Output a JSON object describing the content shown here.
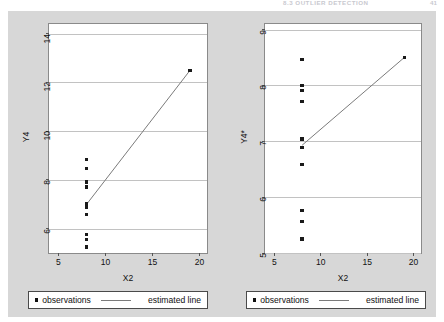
{
  "running_head": {
    "title": "8.3 OUTLIER DETECTION",
    "page": "41"
  },
  "figure": {
    "background_color": "#d7d7d7",
    "plot_background_color": "#ffffff",
    "marker_color": "#1a1a1a",
    "line_color": "#7b7b7b",
    "grid_color": "#c2c2c2"
  },
  "legend": {
    "marker_label": "observations",
    "line_label": "estimated line"
  },
  "chart_data": [
    {
      "type": "scatter",
      "panel": "left",
      "title": "",
      "xlabel": "X2",
      "ylabel": "Y4",
      "xlim": [
        4.0,
        20.8
      ],
      "ylim": [
        5.0,
        14.4
      ],
      "xticks": [
        5,
        10,
        15,
        20
      ],
      "yticks": [
        6,
        8,
        10,
        12,
        14
      ],
      "grid": "horizontal",
      "legend_position": "below",
      "series": [
        {
          "name": "observations",
          "marker": "square",
          "x": [
            8,
            8,
            8,
            8,
            8,
            8,
            8,
            8,
            8,
            8,
            19
          ],
          "y": [
            6.58,
            5.76,
            7.71,
            8.84,
            8.47,
            7.04,
            5.25,
            5.56,
            7.91,
            6.89,
            12.5
          ]
        },
        {
          "name": "estimated line",
          "type": "line",
          "x": [
            8,
            19
          ],
          "y": [
            7.0,
            12.5
          ]
        }
      ]
    },
    {
      "type": "scatter",
      "panel": "right",
      "title": "",
      "xlabel": "X2",
      "ylabel": "Y4*",
      "xlim": [
        4.0,
        20.8
      ],
      "ylim": [
        5.0,
        9.1
      ],
      "xticks": [
        5,
        10,
        15,
        20
      ],
      "yticks": [
        5,
        6,
        7,
        8,
        9
      ],
      "grid": "horizontal",
      "legend_position": "below",
      "series": [
        {
          "name": "observations",
          "marker": "square",
          "x": [
            8,
            8,
            8,
            8,
            8,
            8,
            8,
            8,
            8,
            8,
            19
          ],
          "y": [
            6.58,
            5.76,
            7.71,
            8.47,
            7.91,
            7.04,
            5.25,
            5.56,
            8.0,
            6.89,
            8.5
          ]
        },
        {
          "name": "estimated line",
          "type": "line",
          "x": [
            8,
            19
          ],
          "y": [
            6.93,
            8.5
          ]
        }
      ]
    }
  ]
}
